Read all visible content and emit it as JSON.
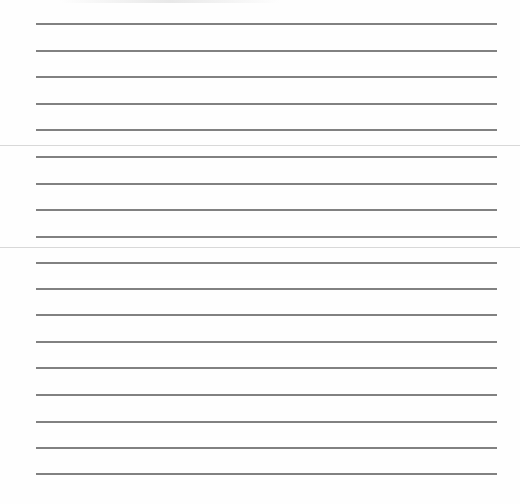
{
  "document": {
    "type": "ruled-writing-page",
    "background_color": "#ffffff",
    "rule_color": "#6b6b6b",
    "divider_color": "#d8d8d8",
    "rule_left_px": 36,
    "rule_right_px": 497,
    "rules_y": [
      23,
      50,
      76,
      103,
      129,
      156,
      183,
      209,
      236,
      262,
      288,
      314,
      341,
      367,
      394,
      421,
      447,
      473
    ],
    "dividers_y": [
      145,
      247
    ]
  }
}
